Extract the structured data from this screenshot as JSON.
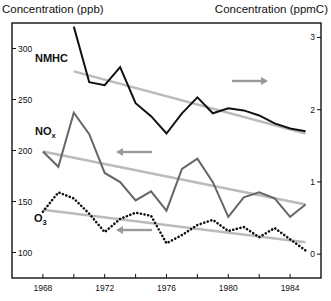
{
  "chart_data": {
    "type": "line",
    "title": "",
    "xlabel": "",
    "ylabel_left": "Concentration (ppb)",
    "ylabel_right": "Concentration (ppmC)",
    "x": [
      1968,
      1969,
      1970,
      1971,
      1972,
      1973,
      1974,
      1975,
      1976,
      1977,
      1978,
      1979,
      1980,
      1981,
      1982,
      1983,
      1984,
      1985
    ],
    "xlim": [
      1966,
      1986
    ],
    "x_ticks": [
      1968,
      1970,
      1972,
      1974,
      1976,
      1978,
      1980,
      1982,
      1984
    ],
    "x_tick_labels": [
      "1968",
      "1972",
      "1976",
      "1980",
      "1984"
    ],
    "ylim_left": [
      75,
      325
    ],
    "y_ticks_left": [
      100,
      150,
      200,
      250,
      300
    ],
    "ylim_right": [
      -0.33,
      3.2
    ],
    "y_ticks_right": [
      0,
      1,
      2,
      3
    ],
    "grid": false,
    "legend_position": "inline labels",
    "series": [
      {
        "name": "NMHC",
        "label": "NMHC",
        "axis": "right",
        "unit": "ppmC",
        "style": "solid",
        "color": "#111111",
        "x": [
          1970,
          1971,
          1972,
          1973,
          1974,
          1975,
          1976,
          1977,
          1978,
          1979,
          1980,
          1981,
          1982,
          1983,
          1984,
          1985
        ],
        "values": [
          3.15,
          2.38,
          2.34,
          2.59,
          2.09,
          1.91,
          1.67,
          1.95,
          2.17,
          1.95,
          2.02,
          1.99,
          1.92,
          1.81,
          1.74,
          1.7
        ],
        "trend": {
          "x": [
            1970,
            1985
          ],
          "values": [
            2.53,
            1.67
          ]
        },
        "arrow_direction": "right"
      },
      {
        "name": "NOx",
        "label": "NO",
        "label_sub": "x",
        "axis": "left",
        "unit": "ppb",
        "style": "solid",
        "color": "#666666",
        "x": [
          1968,
          1969,
          1970,
          1971,
          1972,
          1973,
          1974,
          1975,
          1976,
          1977,
          1978,
          1979,
          1980,
          1981,
          1982,
          1983,
          1984,
          1985
        ],
        "values": [
          199,
          184,
          237,
          216,
          178,
          169,
          151,
          160,
          141,
          182,
          192,
          169,
          135,
          154,
          159,
          153,
          135,
          147
        ],
        "trend": {
          "x": [
            1968,
            1985
          ],
          "values": [
            199,
            147
          ]
        },
        "arrow_direction": "left"
      },
      {
        "name": "O3",
        "label": "O",
        "label_sub": "3",
        "axis": "left",
        "unit": "ppb",
        "style": "dotted",
        "color": "#111111",
        "x": [
          1968,
          1969,
          1970,
          1971,
          1972,
          1973,
          1974,
          1975,
          1976,
          1977,
          1978,
          1979,
          1980,
          1981,
          1982,
          1983,
          1984,
          1985
        ],
        "values": [
          140,
          159,
          153,
          138,
          120,
          133,
          139,
          136,
          109,
          117,
          127,
          132,
          121,
          125,
          115,
          124,
          113,
          102
        ],
        "trend": {
          "x": [
            1968,
            1985
          ],
          "values": [
            142,
            110
          ]
        },
        "arrow_direction": "left"
      }
    ],
    "annotations": [
      "Arrows indicate which y-axis each series is read against (inferred): NMHC → right axis (ppmC); NOx and O3 → left axis (ppb)."
    ]
  },
  "colors": {
    "axis": "#111111",
    "trend": "#bbbbbb",
    "arrow": "#999999"
  }
}
